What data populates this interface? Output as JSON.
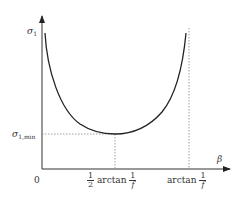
{
  "diagram": {
    "type": "function-curve",
    "y_axis": {
      "label": "σ",
      "label_sub": "1"
    },
    "x_axis": {
      "label": "β"
    },
    "origin_label": "0",
    "min_value_label": {
      "symbol": "σ",
      "sub": "1,min"
    },
    "x_ticks": [
      {
        "prefix_num": "1",
        "prefix_den": "2",
        "func": "arctan",
        "num": "1",
        "den": "f"
      },
      {
        "func": "arctan",
        "num": "1",
        "den": "f"
      }
    ],
    "colors": {
      "curve": "#222222",
      "axis": "#333333",
      "guide": "#888888"
    }
  }
}
